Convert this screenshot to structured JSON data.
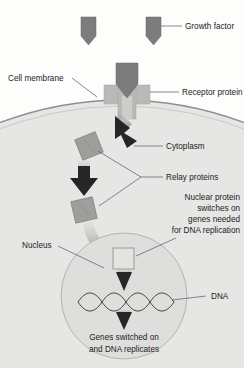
{
  "diagram": {
    "labels": {
      "growth_factor": "Growth factor",
      "cell_membrane": "Cell membrane",
      "receptor_protein": "Receptor protein",
      "cytoplasm": "Cytoplasm",
      "relay_proteins": "Relay proteins",
      "nucleus": "Nucleus",
      "dna": "DNA"
    },
    "nuclear_protein_note": {
      "line1": "Nuclear protein",
      "line2": "switches on",
      "line3": "genes needed",
      "line4": "for DNA replication"
    },
    "outcome_caption": {
      "line1": "Genes switched on",
      "line2": "and DNA replicates"
    },
    "colors": {
      "background": "#fdfdfc",
      "cytoplasm_fill": "#e6e6e4",
      "nucleus_fill": "#dededc",
      "membrane_stroke": "#8e8e8e",
      "protein_fill": "#7c7c7c",
      "receptor_fill": "#b9b9b7",
      "relay_fill": "#9e9e9c",
      "arrow_fill": "#262626",
      "leader_line": "#55565a",
      "text": "#1c1c1c"
    },
    "elements": {
      "growth_factor_count": 3,
      "relay_protein_count": 2,
      "nuclear_protein_count": 1,
      "arrow_count": 4,
      "dna_strand_turns": 4
    }
  }
}
